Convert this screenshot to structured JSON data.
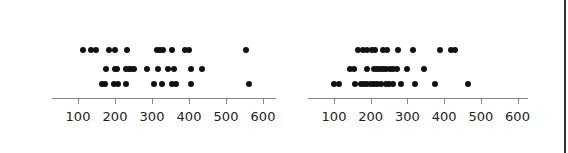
{
  "chart_data": [
    {
      "type": "scatter",
      "title": "",
      "xlabel": "",
      "ylabel": "",
      "xlim": [
        30,
        630
      ],
      "xticks": [
        100,
        200,
        300,
        400,
        500,
        600
      ],
      "grid": false,
      "rows": [
        [
          113,
          135,
          149,
          184,
          200,
          232,
          313,
          321,
          329,
          354,
          389,
          400,
          554
        ],
        [
          175,
          200,
          205,
          230,
          238,
          243,
          251,
          286,
          316,
          343,
          359,
          405,
          435
        ],
        [
          165,
          173,
          197,
          208,
          230,
          305,
          327,
          355,
          365,
          405,
          562
        ]
      ]
    },
    {
      "type": "scatter",
      "title": "",
      "xlabel": "",
      "ylabel": "",
      "xlim": [
        30,
        630
      ],
      "xticks": [
        100,
        200,
        300,
        400,
        500,
        600
      ],
      "grid": false,
      "rows": [
        [
          165,
          179,
          190,
          204,
          212,
          234,
          245,
          275,
          316,
          390,
          420,
          431
        ],
        [
          143,
          154,
          190,
          209,
          217,
          226,
          234,
          242,
          253,
          261,
          272,
          300,
          346
        ],
        [
          100,
          114,
          157,
          174,
          182,
          190,
          201,
          209,
          217,
          228,
          242,
          250,
          261,
          283,
          321,
          375,
          465
        ]
      ]
    }
  ],
  "panels": [
    {
      "x100": 78,
      "px_per_100": 37,
      "axis_start": 52,
      "axis_end": 276
    },
    {
      "x100": 334,
      "px_per_100": 36.7,
      "axis_start": 308,
      "axis_end": 528
    }
  ],
  "row_y": [
    50,
    69,
    84
  ],
  "axis_y": 98,
  "label_y": 109
}
